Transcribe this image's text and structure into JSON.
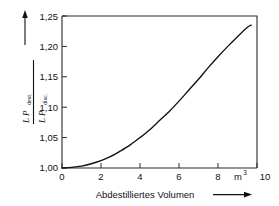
{
  "chart_data": {
    "type": "line",
    "title": "",
    "subtitle": "",
    "xlabel": "Abdestilliertes  Volumen",
    "xunit": "m",
    "xunit_exponent": "3",
    "ylabel_numerator": "L P",
    "ylabel_numerator_sub": "dest.",
    "ylabel_denominator": "L P",
    "ylabel_denominator_sub": "disc.",
    "xlim": [
      0,
      10
    ],
    "ylim": [
      1.0,
      1.25
    ],
    "xticks": [
      0,
      2,
      4,
      6,
      8,
      10
    ],
    "xtick_labels": [
      "0",
      "2",
      "4",
      "6",
      "8",
      "10"
    ],
    "yticks": [
      1.0,
      1.05,
      1.1,
      1.15,
      1.2,
      1.25
    ],
    "ytick_labels": [
      "1,00",
      "1,05",
      "1,10",
      "1,15",
      "1,20",
      "1,25"
    ],
    "grid": false,
    "legend": false,
    "legend_position": "none",
    "series": [
      {
        "name": "Leistungsverhaeltnis",
        "x": [
          0.0,
          0.5,
          1.0,
          1.5,
          2.0,
          2.5,
          3.0,
          3.5,
          4.0,
          4.5,
          5.0,
          5.5,
          6.0,
          6.5,
          7.0,
          7.5,
          8.0,
          8.5,
          9.0,
          9.5,
          9.7
        ],
        "values": [
          1.0,
          1.001,
          1.003,
          1.007,
          1.012,
          1.019,
          1.028,
          1.038,
          1.05,
          1.063,
          1.078,
          1.093,
          1.11,
          1.128,
          1.146,
          1.165,
          1.183,
          1.2,
          1.216,
          1.231,
          1.235
        ]
      }
    ],
    "annotations": [
      {
        "name": "x-axis-arrow",
        "text": "",
        "direction": "right"
      },
      {
        "name": "y-axis-arrow",
        "text": "",
        "direction": "up"
      }
    ],
    "colors": {
      "curve": "#111111",
      "frame": "#2b2b2b",
      "background": "#ffffff",
      "text": "#111111"
    }
  },
  "figure": {
    "background_color": "#ffffff"
  }
}
